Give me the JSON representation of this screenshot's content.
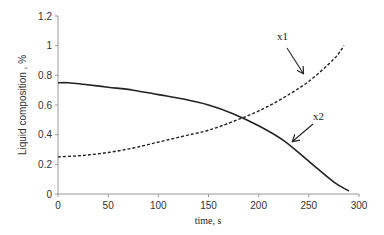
{
  "chart_data": {
    "type": "line",
    "title": "",
    "xlabel": "time, s",
    "ylabel": "Liquid  composition , %",
    "xlim": [
      0,
      300
    ],
    "ylim": [
      0,
      1.2
    ],
    "xticks": [
      0,
      50,
      100,
      150,
      200,
      250,
      300
    ],
    "yticks": [
      0,
      0.2,
      0.4,
      0.6,
      0.8,
      1,
      1.2
    ],
    "xtick_labels": [
      "0",
      "50",
      "100",
      "150",
      "200",
      "250",
      "300"
    ],
    "ytick_labels": [
      "0",
      "0.2",
      "0.4",
      "0.6",
      "0.8",
      "1",
      "1.2"
    ],
    "grid": false,
    "legend": "none (inline arrow annotations)",
    "series": [
      {
        "name": "x1",
        "style": "dashed",
        "x": [
          0,
          25,
          50,
          75,
          100,
          125,
          150,
          175,
          200,
          225,
          250,
          275,
          285
        ],
        "y": [
          0.25,
          0.26,
          0.28,
          0.31,
          0.35,
          0.39,
          0.43,
          0.49,
          0.56,
          0.65,
          0.76,
          0.91,
          1.0
        ]
      },
      {
        "name": "x2",
        "style": "solid",
        "x": [
          0,
          10,
          25,
          50,
          75,
          100,
          125,
          150,
          175,
          200,
          225,
          250,
          275,
          290
        ],
        "y": [
          0.75,
          0.75,
          0.74,
          0.72,
          0.7,
          0.67,
          0.64,
          0.6,
          0.54,
          0.46,
          0.36,
          0.22,
          0.08,
          0.02
        ]
      }
    ],
    "annotations": [
      {
        "text": "x1",
        "points_to": "x1 curve near t≈240"
      },
      {
        "text": "x2",
        "points_to": "x2 curve near t≈225"
      }
    ]
  }
}
